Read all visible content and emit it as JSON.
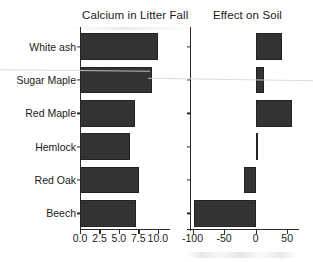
{
  "chart_data": {
    "type": "bar",
    "orientation": "horizontal",
    "title": "",
    "categories": [
      "White ash",
      "Sugar Maple",
      "Red Maple",
      "Hemlock",
      "Red Oak",
      "Beech"
    ],
    "panels": [
      {
        "title": "Calcium in Litter Fall",
        "xlabel": "",
        "ylabel": "",
        "xlim": [
          0.0,
          10.8
        ],
        "xticks": [
          0.0,
          2.5,
          5.0,
          7.5,
          10.0
        ],
        "xticklabels": [
          "0.0",
          "2.5",
          "5.0",
          "7.5",
          "10.0"
        ],
        "grid": false,
        "values": [
          10.0,
          9.3,
          7.1,
          6.4,
          7.6,
          7.2
        ]
      },
      {
        "title": "Effect on Soil",
        "xlabel": "",
        "ylabel": "",
        "xlim": [
          -104,
          64
        ],
        "xticks": [
          -100,
          -50,
          0,
          50
        ],
        "xticklabels": [
          "-100",
          "-50",
          "0",
          "50"
        ],
        "grid": false,
        "values": [
          42,
          13,
          58,
          3,
          -18,
          -98
        ]
      }
    ],
    "legend": null,
    "bar_color": "#333333",
    "axis_color": "#2b2b2b",
    "text_color": "#1a1a1a",
    "background": "#ffffff"
  }
}
